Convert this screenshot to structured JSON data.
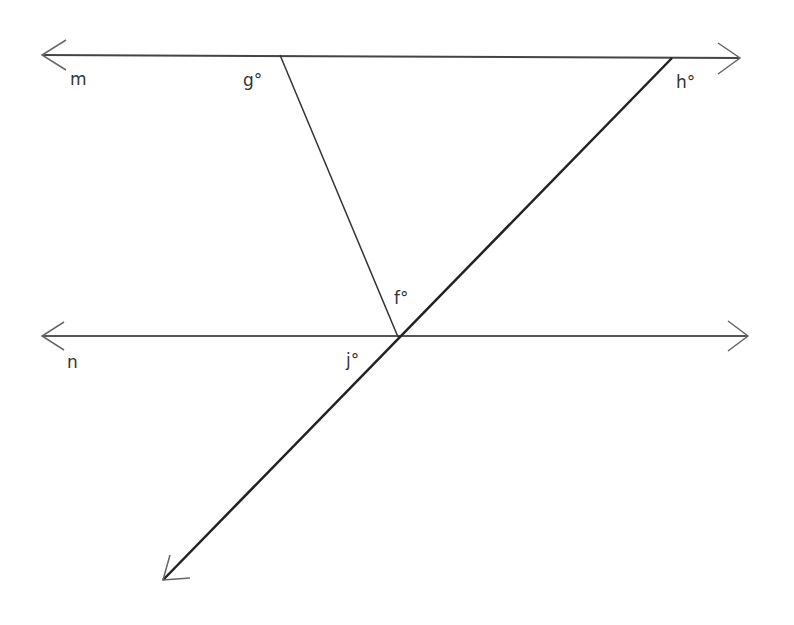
{
  "diagram": {
    "lines": {
      "m": {
        "label": "m",
        "from": [
          42,
          55
        ],
        "to": [
          740,
          58
        ]
      },
      "n": {
        "label": "n",
        "from": [
          42,
          336
        ],
        "to": [
          748,
          336
        ]
      },
      "transversal_1": {
        "from": [
          280,
          55
        ],
        "to": [
          398,
          337
        ]
      },
      "transversal_2": {
        "from": [
          672,
          58
        ],
        "to": [
          163,
          580
        ]
      }
    },
    "angles": {
      "g": "g°",
      "h": "h°",
      "f": "f°",
      "j": "j°"
    },
    "colors": {
      "stroke": "#333333",
      "background": "#ffffff"
    }
  }
}
